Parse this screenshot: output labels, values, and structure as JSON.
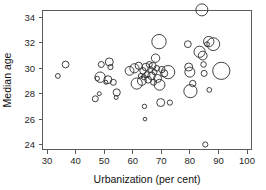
{
  "chart_data": {
    "type": "scatter",
    "title": "",
    "xlabel": "Urbanization (per cent)",
    "ylabel": "Median age",
    "xlim": [
      28,
      102
    ],
    "ylim": [
      23.2,
      35.4
    ],
    "xticks": [
      30,
      40,
      50,
      60,
      70,
      80,
      90,
      100
    ],
    "yticks": [
      24,
      26,
      28,
      30,
      32,
      34
    ],
    "grid": false,
    "legend": "none",
    "marker": "open-circle",
    "size_encoding": "bubble area encodes a third variable (population)",
    "points": [
      {
        "x": 33.8,
        "y": 29.4,
        "r": 2.4
      },
      {
        "x": 36.5,
        "y": 30.3,
        "r": 3.4
      },
      {
        "x": 46.9,
        "y": 27.6,
        "r": 3.0
      },
      {
        "x": 47.6,
        "y": 29.2,
        "r": 2.2
      },
      {
        "x": 48.3,
        "y": 28.0,
        "r": 2.0
      },
      {
        "x": 48.6,
        "y": 29.3,
        "r": 5.2
      },
      {
        "x": 49.0,
        "y": 30.3,
        "r": 3.0
      },
      {
        "x": 50.6,
        "y": 28.9,
        "r": 2.0
      },
      {
        "x": 51.3,
        "y": 29.1,
        "r": 4.0
      },
      {
        "x": 51.8,
        "y": 30.5,
        "r": 4.0
      },
      {
        "x": 52.2,
        "y": 30.1,
        "r": 2.6
      },
      {
        "x": 53.2,
        "y": 28.9,
        "r": 3.0
      },
      {
        "x": 54.2,
        "y": 27.7,
        "r": 2.0
      },
      {
        "x": 54.4,
        "y": 28.1,
        "r": 3.6
      },
      {
        "x": 58.9,
        "y": 29.8,
        "r": 4.4
      },
      {
        "x": 60.6,
        "y": 30.0,
        "r": 4.6
      },
      {
        "x": 61.4,
        "y": 28.8,
        "r": 5.6
      },
      {
        "x": 62.1,
        "y": 30.2,
        "r": 3.6
      },
      {
        "x": 62.8,
        "y": 29.4,
        "r": 2.4
      },
      {
        "x": 63.2,
        "y": 29.0,
        "r": 4.4
      },
      {
        "x": 63.6,
        "y": 29.8,
        "r": 3.2
      },
      {
        "x": 63.9,
        "y": 29.3,
        "r": 2.6
      },
      {
        "x": 64.1,
        "y": 27.0,
        "r": 2.2
      },
      {
        "x": 64.3,
        "y": 26.0,
        "r": 1.8
      },
      {
        "x": 64.6,
        "y": 30.1,
        "r": 3.8
      },
      {
        "x": 65.0,
        "y": 29.5,
        "r": 3.0
      },
      {
        "x": 65.4,
        "y": 29.1,
        "r": 3.4
      },
      {
        "x": 65.8,
        "y": 30.3,
        "r": 3.0
      },
      {
        "x": 66.2,
        "y": 29.9,
        "r": 2.8
      },
      {
        "x": 66.6,
        "y": 29.4,
        "r": 3.8
      },
      {
        "x": 67.0,
        "y": 30.2,
        "r": 3.4
      },
      {
        "x": 67.3,
        "y": 28.9,
        "r": 3.0
      },
      {
        "x": 67.6,
        "y": 29.7,
        "r": 2.6
      },
      {
        "x": 68.0,
        "y": 30.8,
        "r": 4.2
      },
      {
        "x": 68.4,
        "y": 30.0,
        "r": 2.8
      },
      {
        "x": 68.7,
        "y": 29.2,
        "r": 4.0
      },
      {
        "x": 69.2,
        "y": 32.1,
        "r": 7.2
      },
      {
        "x": 69.4,
        "y": 28.7,
        "r": 5.4
      },
      {
        "x": 69.8,
        "y": 27.3,
        "r": 4.0
      },
      {
        "x": 70.2,
        "y": 29.9,
        "r": 3.2
      },
      {
        "x": 71.0,
        "y": 29.6,
        "r": 3.6
      },
      {
        "x": 72.4,
        "y": 29.7,
        "r": 6.6
      },
      {
        "x": 73.0,
        "y": 27.3,
        "r": 2.6
      },
      {
        "x": 79.3,
        "y": 31.9,
        "r": 3.4
      },
      {
        "x": 79.6,
        "y": 30.1,
        "r": 4.0
      },
      {
        "x": 80.0,
        "y": 29.7,
        "r": 5.0
      },
      {
        "x": 80.2,
        "y": 28.2,
        "r": 6.6
      },
      {
        "x": 81.0,
        "y": 28.8,
        "r": 3.2
      },
      {
        "x": 83.4,
        "y": 31.3,
        "r": 5.6
      },
      {
        "x": 84.2,
        "y": 34.6,
        "r": 6.0
      },
      {
        "x": 84.5,
        "y": 31.0,
        "r": 4.4
      },
      {
        "x": 84.8,
        "y": 30.3,
        "r": 2.8
      },
      {
        "x": 85.0,
        "y": 29.6,
        "r": 3.0
      },
      {
        "x": 85.4,
        "y": 24.0,
        "r": 2.6
      },
      {
        "x": 86.0,
        "y": 31.9,
        "r": 2.4
      },
      {
        "x": 86.6,
        "y": 32.1,
        "r": 5.2
      },
      {
        "x": 86.8,
        "y": 28.3,
        "r": 2.4
      },
      {
        "x": 88.2,
        "y": 31.9,
        "r": 6.4
      },
      {
        "x": 91.0,
        "y": 29.8,
        "r": 8.6
      }
    ]
  },
  "style": {
    "axis_color": "#5b5b5b",
    "marker_stroke": "#2c2c2c",
    "text_color": "#1a1a1a",
    "background": "#ffffff"
  }
}
